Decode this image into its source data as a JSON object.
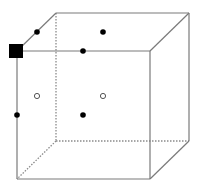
{
  "diagram": {
    "colors": {
      "background": "#ffffff",
      "edge": "#7a7a7a",
      "hidden_edge": "#8a8a8a",
      "point_fill": "#000000",
      "hollow_stroke": "#555555",
      "origin_marker": "#000000"
    },
    "vertices": {
      "front_top_left": {
        "x": 17,
        "y": 51
      },
      "front_top_right": {
        "x": 150,
        "y": 51
      },
      "front_bottom_left": {
        "x": 17,
        "y": 179
      },
      "front_bottom_right": {
        "x": 150,
        "y": 179
      },
      "back_top_left": {
        "x": 56,
        "y": 13
      },
      "back_top_right": {
        "x": 189,
        "y": 13
      },
      "back_bottom_left": {
        "x": 56,
        "y": 141
      },
      "back_bottom_right": {
        "x": 189,
        "y": 141
      }
    },
    "origin_marker": {
      "x": 17,
      "y": 51,
      "size": 14
    },
    "filled_points": [
      {
        "id": "edge-midpoint-top-left-diagonal",
        "x": 37,
        "y": 32
      },
      {
        "id": "top-face-center",
        "x": 103,
        "y": 32
      },
      {
        "id": "edge-midpoint-front-top",
        "x": 83,
        "y": 51
      },
      {
        "id": "edge-midpoint-front-left",
        "x": 17,
        "y": 115
      },
      {
        "id": "front-face-center",
        "x": 83,
        "y": 115
      }
    ],
    "hollow_points": [
      {
        "id": "left-face-center",
        "x": 37,
        "y": 96
      },
      {
        "id": "back-face-center",
        "x": 103,
        "y": 96
      }
    ]
  }
}
